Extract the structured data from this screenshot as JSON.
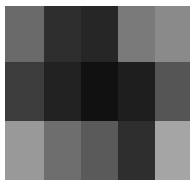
{
  "chart_data": {
    "type": "heatmap",
    "title": "",
    "xlabel": "",
    "ylabel": "",
    "rows": 3,
    "cols": 5,
    "colormap": "grayscale",
    "cells": [
      [
        "#6a6a6a",
        "#2e2e2e",
        "#262626",
        "#7a7a7a",
        "#8a8a8a"
      ],
      [
        "#3c3c3c",
        "#222222",
        "#111111",
        "#1e1e1e",
        "#555555"
      ],
      [
        "#999999",
        "#6e6e6e",
        "#5a5a5a",
        "#2e2e2e",
        "#a5a5a5"
      ]
    ],
    "intensity": [
      [
        0.42,
        0.18,
        0.15,
        0.48,
        0.54
      ],
      [
        0.24,
        0.13,
        0.07,
        0.12,
        0.33
      ],
      [
        0.6,
        0.43,
        0.35,
        0.18,
        0.65
      ]
    ]
  }
}
